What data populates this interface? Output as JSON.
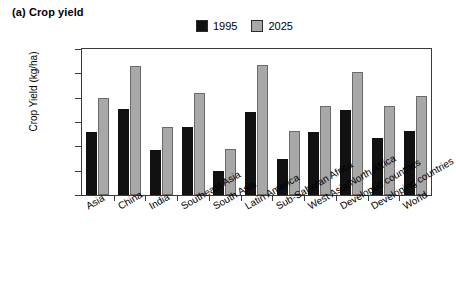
{
  "chart_data": {
    "type": "bar",
    "title": "(a) Crop yield",
    "xlabel": "",
    "ylabel": "Crop Yield (kg/ha)",
    "ylim": [
      1000,
      7000
    ],
    "ytick_labels": [
      "7,000",
      "6,000",
      "5,000",
      "4,000",
      "3,000",
      "2,000",
      "1,000"
    ],
    "ytick_values": [
      7000,
      6000,
      5000,
      4000,
      3000,
      2000,
      1000
    ],
    "grid": false,
    "legend_position": "top-center",
    "categories": [
      "Asia",
      "China",
      "India",
      "Southeast Asia",
      "South Asia",
      "Latin America",
      "Sub-Saharan Africa",
      "West Asia/North Africa",
      "Developed countries",
      "Developing countries",
      "World"
    ],
    "series": [
      {
        "name": "1995",
        "color": "#111111",
        "values": [
          3600,
          4550,
          2850,
          3800,
          1980,
          4400,
          2500,
          3600,
          4500,
          3350,
          3650
        ]
      },
      {
        "name": "2025",
        "color": "#a8a8a8",
        "values": [
          5000,
          6300,
          3800,
          5200,
          2900,
          6350,
          3650,
          4650,
          6050,
          4650,
          5050
        ]
      }
    ]
  }
}
